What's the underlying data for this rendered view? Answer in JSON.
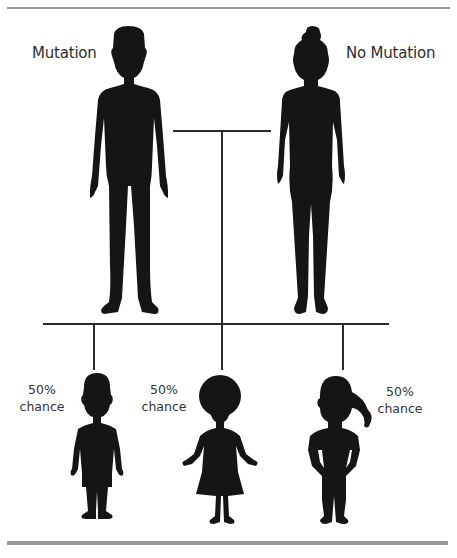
{
  "diagram": {
    "type": "inheritance-pedigree",
    "parents": [
      {
        "label": "Mutation",
        "figure": "adult-man-silhouette"
      },
      {
        "label": "No Mutation",
        "figure": "adult-woman-silhouette"
      }
    ],
    "children": [
      {
        "probability": "50%",
        "caption": "chance",
        "figure": "boy-silhouette"
      },
      {
        "probability": "50%",
        "caption": "chance",
        "figure": "curly-hair-girl-silhouette"
      },
      {
        "probability": "50%",
        "caption": "chance",
        "figure": "ponytail-girl-silhouette"
      }
    ],
    "colors": {
      "silhouette": "#151515",
      "connector": "#2a2a2a",
      "rule": "#9a9a9a",
      "text": "#2b2b2b"
    }
  }
}
